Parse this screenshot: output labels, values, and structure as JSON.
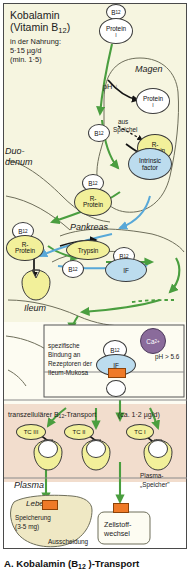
{
  "figure": {
    "caption": "A. Kobalamin (B12 )-Transport",
    "caption_main": "A. Kobalamin (B",
    "caption_sub": "12",
    "caption_tail": " )-Transport"
  },
  "intro": {
    "title_line1": "Kobalamin",
    "title_line2_pre": "(Vitamin B",
    "title_line2_sub": "12",
    "title_line2_post": ")",
    "line3": "in der Nahrung:",
    "line4": "5·15 µg/d",
    "line5": "(min. 1·5)"
  },
  "organs": {
    "stomach": "Magen",
    "duodenum_line1": "Duo-",
    "duodenum_line2": "denum",
    "pancreas": "Pankreas",
    "ileum": "Ileum",
    "plasma": "Plasma",
    "liver": "Leber"
  },
  "molecules": {
    "b12": "B",
    "b12_sub": "12",
    "protein": "Protein",
    "protein_sub": "I",
    "r_protein_line1": "R-",
    "r_protein_line2": "Protein",
    "intrinsic_line1": "Intrinsic",
    "intrinsic_line2": "factor",
    "if": "IF",
    "trypsin": "Trypsin",
    "calcium": "Ca",
    "calcium_sup": "2+",
    "tc3": "TC III",
    "tc2": "TC II",
    "tc1": "TC I"
  },
  "annotations": {
    "ph_down": "pH ↓",
    "saliva_line1": "aus",
    "saliva_line2": "Speichel",
    "ph_ileum": "pH > 5.6",
    "binding_line1": "spezifische",
    "binding_line2": "Bindung an",
    "binding_line3": "Rezeptoren der",
    "binding_line4": "Ileum-Mukosa",
    "transport_pre": "transzellulärer B",
    "transport_sub": "12",
    "transport_post": "-Transport",
    "transport_amount": "(ca. 1·2 µg/d)",
    "plasma_store_line1": "Plasma-",
    "plasma_store_line2": "„Speicher\"",
    "storage_line1": "Speicherung",
    "storage_line2": "(3-5 mg)",
    "excretion": "Ausscheidung",
    "metabolism_line1": "Zellstoff-",
    "metabolism_line2": "wechsel"
  },
  "colors": {
    "green_arrow": "#4a9e3f",
    "blue_arrow": "#58a8d8",
    "black_arrow": "#1a1a1a",
    "r_protein": "#f2f09a",
    "intrinsic_factor": "#bcdcee",
    "calcium": "#8a6b9b",
    "receptor": "#ef7a28",
    "plasma_bg": "#f2ddcd",
    "gut_bg": "#f6f5e0"
  }
}
